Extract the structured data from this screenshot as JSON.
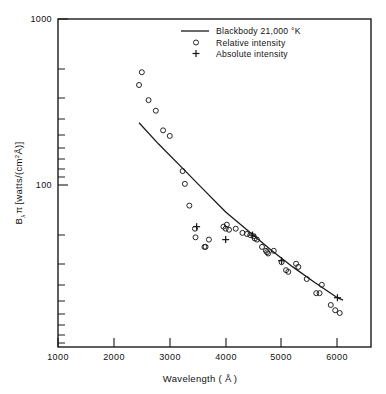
{
  "chart_data": {
    "type": "scatter",
    "title": "",
    "xlabel": "Wavelength ( Å )",
    "ylabel": "Bλ π [watts/(cm²Å)]",
    "xlabel_text": "Wavelength (",
    "xlabel_unit": "Å",
    "xlabel_close": ")",
    "ylabel_prefix": "B",
    "ylabel_sub": "λ",
    "ylabel_pi": "π",
    "ylabel_bracket_open": "[",
    "ylabel_body": "watts/(cm",
    "ylabel_exp": "2",
    "ylabel_angstrom": "Å",
    "ylabel_bracket_close": ")]",
    "xscale": "linear",
    "yscale": "log",
    "xlim": [
      1000,
      6600
    ],
    "ylim": [
      20,
      1000
    ],
    "xticks": [
      1000,
      2000,
      3000,
      4000,
      5000,
      6000
    ],
    "xticklabels": [
      "1000",
      "2000",
      "3000",
      "4000",
      "5000",
      "6000"
    ],
    "yticks": [
      100,
      1000
    ],
    "yticklabels": [
      "100",
      "1000"
    ],
    "grid": false,
    "legend_position": "top-center",
    "legend": [
      {
        "label": "Blackbody  21,000 °K",
        "marker": "line"
      },
      {
        "label": "Relative intensity",
        "marker": "circle"
      },
      {
        "label": "Absolute intensity",
        "marker": "plus"
      }
    ],
    "series": [
      {
        "name": "Blackbody  21,000 °K",
        "type": "line",
        "temperature_K": 21000,
        "points": [
          {
            "x": 2450,
            "y": 290
          },
          {
            "x": 2800,
            "y": 225
          },
          {
            "x": 3200,
            "y": 172
          },
          {
            "x": 3600,
            "y": 131
          },
          {
            "x": 4000,
            "y": 100
          },
          {
            "x": 4400,
            "y": 80
          },
          {
            "x": 4800,
            "y": 64
          },
          {
            "x": 5200,
            "y": 52
          },
          {
            "x": 5600,
            "y": 43
          },
          {
            "x": 6000,
            "y": 36
          },
          {
            "x": 6100,
            "y": 35
          }
        ]
      },
      {
        "name": "Relative intensity",
        "type": "scatter",
        "marker": "circle",
        "points": [
          {
            "x": 2500,
            "y": 530
          },
          {
            "x": 2450,
            "y": 455
          },
          {
            "x": 2620,
            "y": 380
          },
          {
            "x": 2750,
            "y": 335
          },
          {
            "x": 2880,
            "y": 265
          },
          {
            "x": 3000,
            "y": 248
          },
          {
            "x": 3230,
            "y": 163
          },
          {
            "x": 3270,
            "y": 140
          },
          {
            "x": 3350,
            "y": 108
          },
          {
            "x": 3450,
            "y": 82
          },
          {
            "x": 3460,
            "y": 74
          },
          {
            "x": 3620,
            "y": 66
          },
          {
            "x": 3640,
            "y": 66
          },
          {
            "x": 3700,
            "y": 72
          },
          {
            "x": 3960,
            "y": 84
          },
          {
            "x": 4000,
            "y": 82
          },
          {
            "x": 4020,
            "y": 86
          },
          {
            "x": 4060,
            "y": 81
          },
          {
            "x": 4180,
            "y": 82
          },
          {
            "x": 4300,
            "y": 78
          },
          {
            "x": 4380,
            "y": 77
          },
          {
            "x": 4440,
            "y": 76
          },
          {
            "x": 4500,
            "y": 75
          },
          {
            "x": 4520,
            "y": 73
          },
          {
            "x": 4560,
            "y": 72
          },
          {
            "x": 4650,
            "y": 66
          },
          {
            "x": 4720,
            "y": 63
          },
          {
            "x": 4740,
            "y": 62
          },
          {
            "x": 4760,
            "y": 61
          },
          {
            "x": 4860,
            "y": 63
          },
          {
            "x": 5000,
            "y": 55
          },
          {
            "x": 5080,
            "y": 50
          },
          {
            "x": 5120,
            "y": 49
          },
          {
            "x": 5260,
            "y": 54
          },
          {
            "x": 5300,
            "y": 52
          },
          {
            "x": 5450,
            "y": 45
          },
          {
            "x": 5620,
            "y": 38
          },
          {
            "x": 5680,
            "y": 38
          },
          {
            "x": 5720,
            "y": 42
          },
          {
            "x": 5880,
            "y": 33
          },
          {
            "x": 5960,
            "y": 31
          },
          {
            "x": 6040,
            "y": 30
          }
        ]
      },
      {
        "name": "Absolute intensity",
        "type": "scatter",
        "marker": "plus",
        "points": [
          {
            "x": 3480,
            "y": 84
          },
          {
            "x": 4000,
            "y": 72
          },
          {
            "x": 4480,
            "y": 76
          },
          {
            "x": 5000,
            "y": 56
          },
          {
            "x": 6000,
            "y": 36
          }
        ]
      }
    ]
  },
  "colors": {
    "ink": "#1a1a1a",
    "background": "#ffffff"
  }
}
